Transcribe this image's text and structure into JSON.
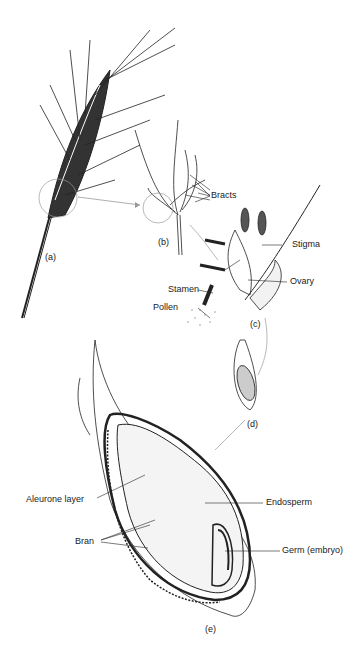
{
  "diagram": {
    "panels": {
      "a": "(a)",
      "b": "(b)",
      "c": "(c)",
      "d": "(d)",
      "e": "(e)"
    },
    "labels": {
      "bracts": "Bracts",
      "stigma": "Stigma",
      "ovary": "Ovary",
      "stamen": "Stamen",
      "pollen": "Pollen",
      "aleurone": "Aleurone layer",
      "endosperm": "Endosperm",
      "bran": "Bran",
      "germ": "Germ (embryo)"
    },
    "colors": {
      "ink": "#222222",
      "arrow": "#999999",
      "fill_light": "#e8e8e8"
    }
  }
}
